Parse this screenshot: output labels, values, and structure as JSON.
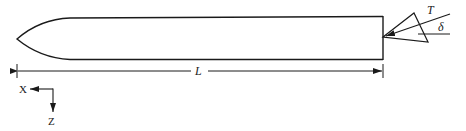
{
  "figure": {
    "colors": {
      "stroke": "#1a1a1a",
      "text": "#222222",
      "background": "#ffffff"
    },
    "labels": {
      "thrust": "T",
      "deflection_angle": "δ",
      "length": "L",
      "x_axis": "X",
      "z_axis": "Z"
    }
  }
}
